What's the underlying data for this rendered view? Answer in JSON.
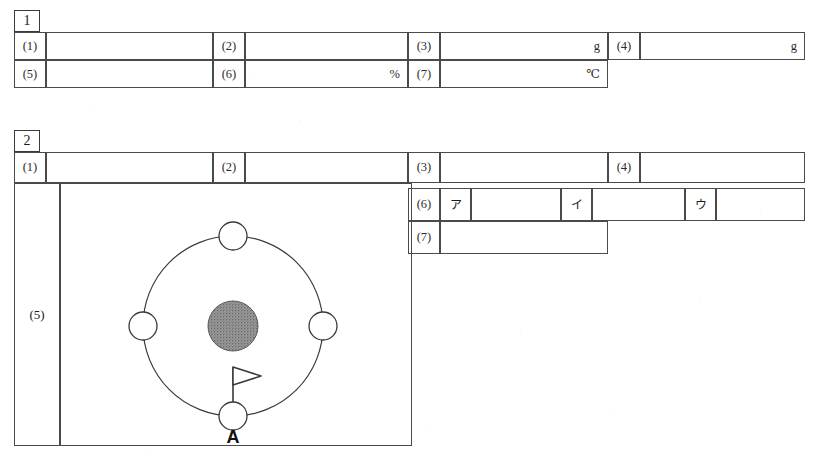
{
  "page": {
    "background": "#ffffff",
    "ink": "#2c2c2c",
    "rule": "#4a4a4a"
  },
  "sections": [
    {
      "id": "section-1",
      "number": "1",
      "rows": [
        {
          "id": "s1-row-1",
          "cells": [
            {
              "kind": "label",
              "text": "(1)"
            },
            {
              "kind": "answer",
              "text": ""
            },
            {
              "kind": "label",
              "text": "(2)"
            },
            {
              "kind": "answer",
              "text": ""
            },
            {
              "kind": "label",
              "text": "(3)"
            },
            {
              "kind": "answer",
              "text": "g"
            },
            {
              "kind": "label",
              "text": "(4)"
            },
            {
              "kind": "answer",
              "text": "g"
            }
          ]
        },
        {
          "id": "s1-row-2",
          "cells": [
            {
              "kind": "label",
              "text": "(5)"
            },
            {
              "kind": "answer",
              "text": ""
            },
            {
              "kind": "label",
              "text": "(6)"
            },
            {
              "kind": "answer",
              "text": "%"
            },
            {
              "kind": "label",
              "text": "(7)"
            },
            {
              "kind": "answer",
              "text": "℃"
            }
          ]
        }
      ]
    },
    {
      "id": "section-2",
      "number": "2",
      "rows": [
        {
          "id": "s2-row-1",
          "cells": [
            {
              "kind": "label",
              "text": "(1)"
            },
            {
              "kind": "answer",
              "text": ""
            },
            {
              "kind": "label",
              "text": "(2)"
            },
            {
              "kind": "answer",
              "text": ""
            },
            {
              "kind": "label",
              "text": "(3)"
            },
            {
              "kind": "answer",
              "text": ""
            },
            {
              "kind": "label",
              "text": "(4)"
            },
            {
              "kind": "answer",
              "text": ""
            }
          ]
        },
        {
          "id": "s2-row-6",
          "cells": [
            {
              "kind": "label",
              "text": "(6)"
            },
            {
              "kind": "kana",
              "text": "ア"
            },
            {
              "kind": "answer",
              "text": ""
            },
            {
              "kind": "kana",
              "text": "イ"
            },
            {
              "kind": "answer",
              "text": ""
            },
            {
              "kind": "kana",
              "text": "ウ"
            },
            {
              "kind": "answer",
              "text": ""
            }
          ]
        },
        {
          "id": "s2-row-7",
          "cells": [
            {
              "kind": "label",
              "text": "(7)"
            },
            {
              "kind": "answer",
              "text": ""
            }
          ]
        }
      ],
      "question5": {
        "label": "(5)",
        "diagram": {
          "name": "moon-orbit-diagram",
          "center_body": {
            "name": "earth",
            "fill": "#8c8c8c",
            "style": "stippled"
          },
          "orbit": {
            "name": "moon-orbit-path",
            "stroke": "#3a3a3a"
          },
          "moons": [
            {
              "name": "moon-top",
              "position": "top",
              "fill": "#ffffff"
            },
            {
              "name": "moon-right",
              "position": "right",
              "fill": "#ffffff"
            },
            {
              "name": "moon-bottom",
              "position": "bottom",
              "fill": "#ffffff",
              "label": "A",
              "flag": true
            },
            {
              "name": "moon-left",
              "position": "left",
              "fill": "#ffffff"
            }
          ],
          "flag": {
            "name": "observer-flag",
            "direction": "right"
          },
          "point_label": "A"
        }
      }
    }
  ]
}
